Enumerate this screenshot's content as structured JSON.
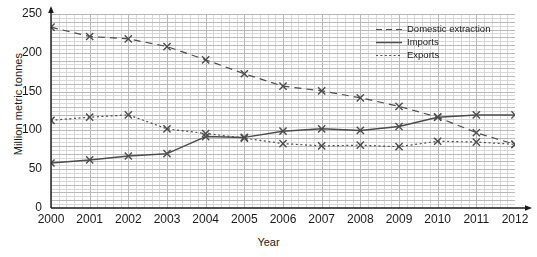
{
  "chart_data": {
    "type": "line",
    "title": "",
    "xlabel": "Year",
    "ylabel": "Million metric tonnes",
    "x": [
      2000,
      2001,
      2002,
      2003,
      2004,
      2005,
      2006,
      2007,
      2008,
      2009,
      2010,
      2011,
      2012
    ],
    "categories": [
      "2000",
      "2001",
      "2002",
      "2003",
      "2004",
      "2005",
      "2006",
      "2007",
      "2008",
      "2009",
      "2010",
      "2011",
      "2012"
    ],
    "xlim": [
      2000,
      2012
    ],
    "ylim": [
      0,
      250
    ],
    "yticks": [
      0,
      50,
      100,
      150,
      200,
      250
    ],
    "xticks": [
      "2000",
      "2001",
      "2002",
      "2003",
      "2004",
      "2005",
      "2006",
      "2007",
      "2008",
      "2009",
      "2010",
      "2011",
      "2012"
    ],
    "grid": true,
    "minor_grid": true,
    "legend_position": "top-right",
    "marker": "x",
    "series": [
      {
        "name": "Domestic extraction",
        "style": "dashed",
        "color": "#4d4d4d",
        "values": [
          233,
          221,
          218,
          208,
          191,
          173,
          157,
          151,
          142,
          131,
          117,
          97,
          82
        ]
      },
      {
        "name": "Imports",
        "style": "solid",
        "color": "#4d4d4d",
        "values": [
          58,
          62,
          67,
          70,
          92,
          91,
          99,
          102,
          100,
          105,
          117,
          120,
          120
        ]
      },
      {
        "name": "Exports",
        "style": "dotted",
        "color": "#4d4d4d",
        "values": [
          113,
          117,
          120,
          102,
          96,
          90,
          83,
          80,
          81,
          79,
          86,
          85,
          82
        ]
      }
    ]
  },
  "legend": {
    "items": [
      {
        "label": "Domestic extraction",
        "style": "dashed"
      },
      {
        "label": "Imports",
        "style": "solid"
      },
      {
        "label": "Exports",
        "style": "dotted"
      }
    ]
  },
  "axis": {
    "y_title": "Million metric tonnes",
    "x_title": "Year"
  },
  "colors": {
    "ink": "#1a1a1a",
    "series": "#4d4d4d",
    "grid_minor": "#d8d8d8",
    "grid_major": "#b9b9b9",
    "background": "#ffffff"
  }
}
